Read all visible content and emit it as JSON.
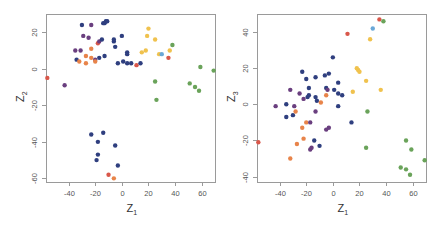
{
  "colors": {
    "navy": "#2f3f7f",
    "purple": "#6a3f7f",
    "orange": "#e8844a",
    "red": "#d9574a",
    "yellow": "#f0c24e",
    "green": "#6aa35a",
    "lightblue": "#6aa8d8"
  },
  "chart_data": [
    {
      "type": "scatter",
      "title": "",
      "xlabel": "Z",
      "xlabel_sub": "1",
      "ylabel": "Z",
      "ylabel_sub": "2",
      "xticks": [
        -40,
        -20,
        0,
        20,
        40,
        60
      ],
      "yticks": [
        20,
        0,
        -20,
        -40,
        -60
      ],
      "xlim": [
        -57,
        70
      ],
      "ylim": [
        -62,
        30
      ],
      "grid": false,
      "legend": null,
      "frame_px": {
        "x0": 46,
        "y0": 14,
        "x1": 215,
        "y1": 182
      },
      "points": [
        {
          "x": -56,
          "y": -5,
          "c": "red"
        },
        {
          "x": -43,
          "y": -9,
          "c": "purple"
        },
        {
          "x": -35,
          "y": 10,
          "c": "purple"
        },
        {
          "x": -34,
          "y": 5,
          "c": "navy"
        },
        {
          "x": -32,
          "y": 4,
          "c": "orange"
        },
        {
          "x": -31,
          "y": 10,
          "c": "purple"
        },
        {
          "x": -30,
          "y": 24,
          "c": "navy"
        },
        {
          "x": -29,
          "y": 18,
          "c": "purple"
        },
        {
          "x": -27,
          "y": 7,
          "c": "orange"
        },
        {
          "x": -27,
          "y": 3,
          "c": "orange"
        },
        {
          "x": -25,
          "y": 17,
          "c": "purple"
        },
        {
          "x": -23,
          "y": 24,
          "c": "purple"
        },
        {
          "x": -23,
          "y": 11,
          "c": "orange"
        },
        {
          "x": -23,
          "y": 6,
          "c": "orange"
        },
        {
          "x": -20,
          "y": 5,
          "c": "purple"
        },
        {
          "x": -20,
          "y": 4,
          "c": "orange"
        },
        {
          "x": -18,
          "y": 14,
          "c": "red"
        },
        {
          "x": -17,
          "y": 15,
          "c": "purple"
        },
        {
          "x": -17,
          "y": 6,
          "c": "navy"
        },
        {
          "x": -15,
          "y": 16,
          "c": "navy"
        },
        {
          "x": -14,
          "y": 25,
          "c": "navy"
        },
        {
          "x": -13,
          "y": 25,
          "c": "navy"
        },
        {
          "x": -13,
          "y": 7,
          "c": "navy"
        },
        {
          "x": -12,
          "y": 26,
          "c": "navy"
        },
        {
          "x": -11,
          "y": 26,
          "c": "navy"
        },
        {
          "x": -6,
          "y": 15,
          "c": "navy"
        },
        {
          "x": -6,
          "y": 16,
          "c": "navy"
        },
        {
          "x": -5,
          "y": 12,
          "c": "navy"
        },
        {
          "x": -3,
          "y": 3,
          "c": "navy"
        },
        {
          "x": 0,
          "y": 18,
          "c": "navy"
        },
        {
          "x": 1,
          "y": 4,
          "c": "navy"
        },
        {
          "x": 4,
          "y": 9,
          "c": "navy"
        },
        {
          "x": 4,
          "y": 8,
          "c": "navy"
        },
        {
          "x": 4,
          "y": 3,
          "c": "navy"
        },
        {
          "x": 7,
          "y": 3,
          "c": "navy"
        },
        {
          "x": 11,
          "y": 2,
          "c": "red"
        },
        {
          "x": 14,
          "y": 3,
          "c": "navy"
        },
        {
          "x": 15,
          "y": 9,
          "c": "yellow"
        },
        {
          "x": 18,
          "y": 10,
          "c": "yellow"
        },
        {
          "x": 19,
          "y": 18,
          "c": "yellow"
        },
        {
          "x": 20,
          "y": 22,
          "c": "yellow"
        },
        {
          "x": 25,
          "y": 16,
          "c": "yellow"
        },
        {
          "x": 25,
          "y": -7,
          "c": "green"
        },
        {
          "x": 26,
          "y": -17,
          "c": "green"
        },
        {
          "x": 28,
          "y": 8,
          "c": "yellow"
        },
        {
          "x": 30,
          "y": 8,
          "c": "lightblue"
        },
        {
          "x": 35,
          "y": 6,
          "c": "red"
        },
        {
          "x": 36,
          "y": 10,
          "c": "yellow"
        },
        {
          "x": 38,
          "y": 13,
          "c": "green"
        },
        {
          "x": 51,
          "y": -8,
          "c": "green"
        },
        {
          "x": 55,
          "y": -10,
          "c": "green"
        },
        {
          "x": 58,
          "y": -12,
          "c": "green"
        },
        {
          "x": 59,
          "y": 1,
          "c": "green"
        },
        {
          "x": 69,
          "y": -1,
          "c": "green"
        },
        {
          "x": -23,
          "y": -36,
          "c": "navy"
        },
        {
          "x": -14,
          "y": -35,
          "c": "navy"
        },
        {
          "x": -18,
          "y": -40,
          "c": "navy"
        },
        {
          "x": -5,
          "y": -42,
          "c": "navy"
        },
        {
          "x": -18,
          "y": -47,
          "c": "navy"
        },
        {
          "x": -19,
          "y": -50,
          "c": "navy"
        },
        {
          "x": -3,
          "y": -53,
          "c": "navy"
        },
        {
          "x": -10,
          "y": -58,
          "c": "red"
        },
        {
          "x": -6,
          "y": -60,
          "c": "orange"
        }
      ]
    },
    {
      "type": "scatter",
      "title": "",
      "xlabel": "Z",
      "xlabel_sub": "1",
      "ylabel": "Z",
      "ylabel_sub": "3",
      "xticks": [
        -40,
        -20,
        0,
        20,
        40,
        60
      ],
      "yticks": [
        40,
        20,
        0,
        -20,
        -40
      ],
      "xlim": [
        -57,
        70
      ],
      "ylim": [
        -43,
        50
      ],
      "grid": false,
      "legend": null,
      "frame_px": {
        "x0": 257,
        "y0": 14,
        "x1": 426,
        "y1": 182
      },
      "points": [
        {
          "x": -56,
          "y": -21,
          "c": "red"
        },
        {
          "x": -43,
          "y": -1,
          "c": "purple"
        },
        {
          "x": -35,
          "y": 0,
          "c": "navy"
        },
        {
          "x": -35,
          "y": -7,
          "c": "navy"
        },
        {
          "x": -32,
          "y": 8,
          "c": "purple"
        },
        {
          "x": -32,
          "y": -30,
          "c": "orange"
        },
        {
          "x": -30,
          "y": -6,
          "c": "navy"
        },
        {
          "x": -29,
          "y": -1,
          "c": "purple"
        },
        {
          "x": -28,
          "y": -4,
          "c": "orange"
        },
        {
          "x": -27,
          "y": -22,
          "c": "orange"
        },
        {
          "x": -25,
          "y": 6,
          "c": "purple"
        },
        {
          "x": -23,
          "y": 18,
          "c": "navy"
        },
        {
          "x": -23,
          "y": -13,
          "c": "orange"
        },
        {
          "x": -22,
          "y": -19,
          "c": "orange"
        },
        {
          "x": -22,
          "y": 3,
          "c": "purple"
        },
        {
          "x": -20,
          "y": 14,
          "c": "navy"
        },
        {
          "x": -20,
          "y": -10,
          "c": "orange"
        },
        {
          "x": -19,
          "y": 4,
          "c": "navy"
        },
        {
          "x": -18,
          "y": 9,
          "c": "navy"
        },
        {
          "x": -18,
          "y": 5,
          "c": "navy"
        },
        {
          "x": -17,
          "y": -25,
          "c": "purple"
        },
        {
          "x": -17,
          "y": -10,
          "c": "purple"
        },
        {
          "x": -16,
          "y": -24,
          "c": "purple"
        },
        {
          "x": -14,
          "y": -20,
          "c": "navy"
        },
        {
          "x": -13,
          "y": 15,
          "c": "navy"
        },
        {
          "x": -13,
          "y": 4,
          "c": "navy"
        },
        {
          "x": -13,
          "y": -4,
          "c": "purple"
        },
        {
          "x": -12,
          "y": 2,
          "c": "navy"
        },
        {
          "x": -10,
          "y": -23,
          "c": "navy"
        },
        {
          "x": -9,
          "y": 1,
          "c": "orange"
        },
        {
          "x": -6,
          "y": 16,
          "c": "navy"
        },
        {
          "x": -5,
          "y": 9,
          "c": "navy"
        },
        {
          "x": -5,
          "y": 5,
          "c": "orange"
        },
        {
          "x": -5,
          "y": -14,
          "c": "purple"
        },
        {
          "x": -4,
          "y": 8,
          "c": "purple"
        },
        {
          "x": -3,
          "y": 17,
          "c": "navy"
        },
        {
          "x": -3,
          "y": -13,
          "c": "purple"
        },
        {
          "x": 0,
          "y": 26,
          "c": "navy"
        },
        {
          "x": 1,
          "y": 8,
          "c": "navy"
        },
        {
          "x": 4,
          "y": 12,
          "c": "navy"
        },
        {
          "x": 4,
          "y": 6,
          "c": "navy"
        },
        {
          "x": 4,
          "y": -1,
          "c": "navy"
        },
        {
          "x": 7,
          "y": 5,
          "c": "navy"
        },
        {
          "x": 11,
          "y": 39,
          "c": "red"
        },
        {
          "x": 14,
          "y": -10,
          "c": "navy"
        },
        {
          "x": 15,
          "y": 7,
          "c": "yellow"
        },
        {
          "x": 18,
          "y": 20,
          "c": "yellow"
        },
        {
          "x": 19,
          "y": 19,
          "c": "yellow"
        },
        {
          "x": 20,
          "y": 18,
          "c": "yellow"
        },
        {
          "x": 25,
          "y": 13,
          "c": "yellow"
        },
        {
          "x": 26,
          "y": -4,
          "c": "green"
        },
        {
          "x": 25,
          "y": -24,
          "c": "green"
        },
        {
          "x": 28,
          "y": 36,
          "c": "yellow"
        },
        {
          "x": 30,
          "y": 42,
          "c": "lightblue"
        },
        {
          "x": 35,
          "y": 47,
          "c": "red"
        },
        {
          "x": 36,
          "y": 8,
          "c": "yellow"
        },
        {
          "x": 38,
          "y": 46,
          "c": "green"
        },
        {
          "x": 51,
          "y": -35,
          "c": "green"
        },
        {
          "x": 55,
          "y": -20,
          "c": "green"
        },
        {
          "x": 55,
          "y": -36,
          "c": "green"
        },
        {
          "x": 58,
          "y": -39,
          "c": "green"
        },
        {
          "x": 59,
          "y": -25,
          "c": "green"
        },
        {
          "x": 69,
          "y": -31,
          "c": "green"
        }
      ]
    }
  ]
}
